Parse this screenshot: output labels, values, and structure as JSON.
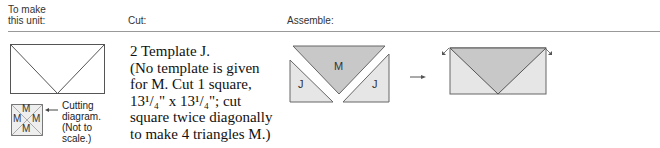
{
  "headers": {
    "make_unit": [
      "To make",
      "this unit:"
    ],
    "cut": "Cut:",
    "assemble": "Assemble:"
  },
  "cut_instructions": {
    "lines": [
      "2 Template J.",
      "(No template is given",
      "for M. Cut 1 square,",
      "13¹/₄\" x 13¹/₄\"; cut",
      "square twice diagonally",
      "to make 4 triangles M.)"
    ]
  },
  "cutting_diagram": {
    "labels": [
      "M",
      "M",
      "M",
      "M"
    ],
    "caption": [
      "Cutting",
      "diagram.",
      "(Not to",
      "scale.)"
    ]
  },
  "assemble": {
    "pieces": {
      "center": "M",
      "left": "J",
      "right": "J"
    },
    "arrow": "→"
  },
  "colors": {
    "piece_m": "#c8c8c8",
    "piece_j": "#e6e6e6",
    "outline": "#555555",
    "rule": "#999999"
  }
}
